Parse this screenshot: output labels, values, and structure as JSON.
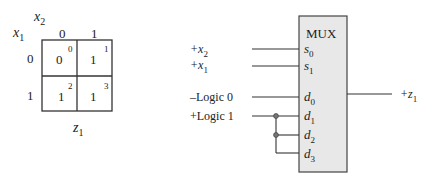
{
  "kmap": {
    "row_var": "x",
    "row_var_sub": "1",
    "col_var": "x",
    "col_var_sub": "2",
    "col_headers": [
      "0",
      "1"
    ],
    "row_headers": [
      "0",
      "1"
    ],
    "cells": [
      {
        "value": "0",
        "index": "0"
      },
      {
        "value": "1",
        "index": "1"
      },
      {
        "value": "1",
        "index": "2"
      },
      {
        "value": "1",
        "index": "3"
      }
    ],
    "output_label": "z",
    "output_sub": "1"
  },
  "mux": {
    "title": "MUX",
    "fill_color": "#e8e8e8",
    "select_pins": [
      {
        "name": "s",
        "sub": "0"
      },
      {
        "name": "s",
        "sub": "1"
      }
    ],
    "data_pins": [
      {
        "name": "d",
        "sub": "0"
      },
      {
        "name": "d",
        "sub": "1"
      },
      {
        "name": "d",
        "sub": "2"
      },
      {
        "name": "d",
        "sub": "3"
      }
    ],
    "inputs": {
      "x2_prefix": "+x",
      "x2_sub": "2",
      "x1_prefix": "+x",
      "x1_sub": "1",
      "logic0": "–Logic 0",
      "logic1": "+Logic 1"
    },
    "output_prefix": "+z",
    "output_sub": "1"
  }
}
